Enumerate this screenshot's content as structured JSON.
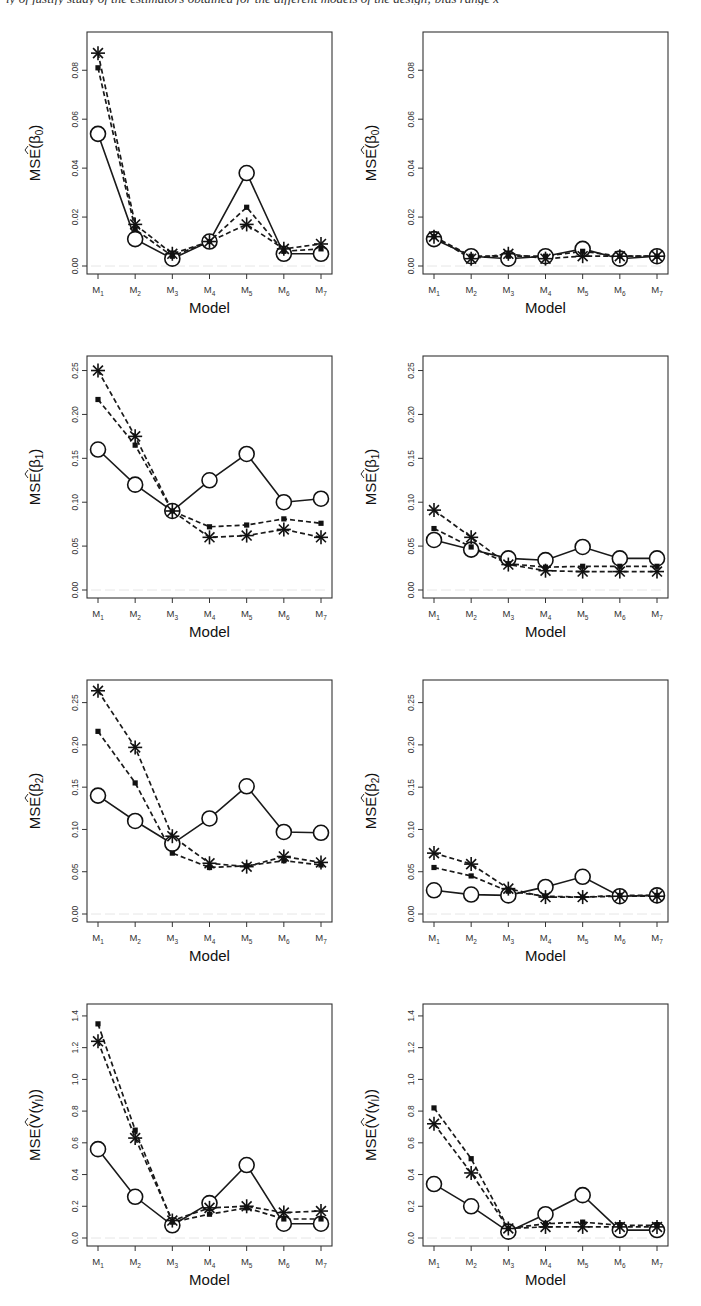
{
  "figure": {
    "caption_fragment": "ly of justify study of the estimators obtained for the different models of the design; bias range x",
    "layout": {
      "rows": 4,
      "cols": 2
    }
  },
  "legend_symbols": {
    "series_a": {
      "name": "circle-solid",
      "marker": "open-circle",
      "line": "solid"
    },
    "series_b": {
      "name": "square-dashed",
      "marker": "filled-square",
      "line": "dashed"
    },
    "series_c": {
      "name": "asterisk-dashed",
      "marker": "asterisk",
      "line": "dashed"
    }
  },
  "chart_data": [
    {
      "id": "beta0-left",
      "type": "line",
      "title": "",
      "xlabel": "Model",
      "ylabel": "MSE(β̂0)",
      "ylabel_parts": {
        "prefix": "MSE(",
        "symbol": "β",
        "sub": "0",
        "suffix": ")",
        "hat": true
      },
      "categories": [
        "M1",
        "M2",
        "M3",
        "M4",
        "M5",
        "M6",
        "M7"
      ],
      "ylim": [
        0,
        0.094
      ],
      "yticks": [
        0.0,
        0.02,
        0.04,
        0.06,
        0.08
      ],
      "ytick_labels": [
        "0.00",
        "0.02",
        "0.04",
        "0.06",
        "0.08"
      ],
      "grid": false,
      "series": [
        {
          "name": "circle-solid",
          "values": [
            0.054,
            0.011,
            0.003,
            0.01,
            0.038,
            0.005,
            0.005
          ]
        },
        {
          "name": "square-dashed",
          "values": [
            0.081,
            0.015,
            0.004,
            0.01,
            0.024,
            0.006,
            0.007
          ]
        },
        {
          "name": "asterisk-dashed",
          "values": [
            0.087,
            0.017,
            0.005,
            0.01,
            0.017,
            0.007,
            0.009
          ]
        }
      ]
    },
    {
      "id": "beta0-right",
      "type": "line",
      "title": "",
      "xlabel": "Model",
      "ylabel": "MSE(β̂0)",
      "ylabel_parts": {
        "prefix": "MSE(",
        "symbol": "β",
        "sub": "0",
        "suffix": ")",
        "hat": true
      },
      "categories": [
        "M1",
        "M2",
        "M3",
        "M4",
        "M5",
        "M6",
        "M7"
      ],
      "ylim": [
        0,
        0.094
      ],
      "yticks": [
        0.0,
        0.02,
        0.04,
        0.06,
        0.08
      ],
      "ytick_labels": [
        "0.00",
        "0.02",
        "0.04",
        "0.06",
        "0.08"
      ],
      "grid": false,
      "series": [
        {
          "name": "circle-solid",
          "values": [
            0.011,
            0.004,
            0.003,
            0.004,
            0.007,
            0.003,
            0.004
          ]
        },
        {
          "name": "square-dashed",
          "values": [
            0.012,
            0.004,
            0.004,
            0.004,
            0.006,
            0.004,
            0.004
          ]
        },
        {
          "name": "asterisk-dashed",
          "values": [
            0.012,
            0.003,
            0.005,
            0.003,
            0.004,
            0.004,
            0.004
          ]
        }
      ]
    },
    {
      "id": "beta1-left",
      "type": "line",
      "title": "",
      "xlabel": "Model",
      "ylabel": "MSE(β̂1)",
      "ylabel_parts": {
        "prefix": "MSE(",
        "symbol": "β",
        "sub": "1",
        "suffix": ")",
        "hat": true
      },
      "categories": [
        "M1",
        "M2",
        "M3",
        "M4",
        "M5",
        "M6",
        "M7"
      ],
      "ylim": [
        0,
        0.262
      ],
      "yticks": [
        0.0,
        0.05,
        0.1,
        0.15,
        0.2,
        0.25
      ],
      "ytick_labels": [
        "0.00",
        "0.05",
        "0.10",
        "0.15",
        "0.20",
        "0.25"
      ],
      "grid": false,
      "series": [
        {
          "name": "circle-solid",
          "values": [
            0.16,
            0.12,
            0.09,
            0.125,
            0.155,
            0.1,
            0.104
          ]
        },
        {
          "name": "square-dashed",
          "values": [
            0.217,
            0.165,
            0.09,
            0.072,
            0.074,
            0.081,
            0.076
          ]
        },
        {
          "name": "asterisk-dashed",
          "values": [
            0.25,
            0.175,
            0.09,
            0.06,
            0.062,
            0.069,
            0.06
          ]
        }
      ]
    },
    {
      "id": "beta1-right",
      "type": "line",
      "title": "",
      "xlabel": "Model",
      "ylabel": "MSE(β̂1)",
      "ylabel_parts": {
        "prefix": "MSE(",
        "symbol": "β",
        "sub": "1",
        "suffix": ")",
        "hat": true
      },
      "categories": [
        "M1",
        "M2",
        "M3",
        "M4",
        "M5",
        "M6",
        "M7"
      ],
      "ylim": [
        0,
        0.262
      ],
      "yticks": [
        0.0,
        0.05,
        0.1,
        0.15,
        0.2,
        0.25
      ],
      "ytick_labels": [
        "0.00",
        "0.05",
        "0.10",
        "0.15",
        "0.20",
        "0.25"
      ],
      "grid": false,
      "series": [
        {
          "name": "circle-solid",
          "values": [
            0.057,
            0.046,
            0.036,
            0.034,
            0.049,
            0.036,
            0.036
          ]
        },
        {
          "name": "square-dashed",
          "values": [
            0.07,
            0.049,
            0.03,
            0.026,
            0.027,
            0.027,
            0.027
          ]
        },
        {
          "name": "asterisk-dashed",
          "values": [
            0.091,
            0.06,
            0.029,
            0.022,
            0.021,
            0.021,
            0.021
          ]
        }
      ]
    },
    {
      "id": "beta2-left",
      "type": "line",
      "title": "",
      "xlabel": "Model",
      "ylabel": "MSE(β̂2)",
      "ylabel_parts": {
        "prefix": "MSE(",
        "symbol": "β",
        "sub": "2",
        "suffix": ")",
        "hat": true
      },
      "categories": [
        "M1",
        "M2",
        "M3",
        "M4",
        "M5",
        "M6",
        "M7"
      ],
      "ylim": [
        0,
        0.272
      ],
      "yticks": [
        0.0,
        0.05,
        0.1,
        0.15,
        0.2,
        0.25
      ],
      "ytick_labels": [
        "0.00",
        "0.05",
        "0.10",
        "0.15",
        "0.20",
        "0.25"
      ],
      "grid": false,
      "series": [
        {
          "name": "circle-solid",
          "values": [
            0.14,
            0.11,
            0.083,
            0.113,
            0.151,
            0.097,
            0.096
          ]
        },
        {
          "name": "square-dashed",
          "values": [
            0.216,
            0.155,
            0.072,
            0.055,
            0.057,
            0.063,
            0.058
          ]
        },
        {
          "name": "asterisk-dashed",
          "values": [
            0.264,
            0.197,
            0.092,
            0.06,
            0.056,
            0.068,
            0.061
          ]
        }
      ]
    },
    {
      "id": "beta2-right",
      "type": "line",
      "title": "",
      "xlabel": "Model",
      "ylabel": "MSE(β̂2)",
      "ylabel_parts": {
        "prefix": "MSE(",
        "symbol": "β",
        "sub": "2",
        "suffix": ")",
        "hat": true
      },
      "categories": [
        "M1",
        "M2",
        "M3",
        "M4",
        "M5",
        "M6",
        "M7"
      ],
      "ylim": [
        0,
        0.272
      ],
      "yticks": [
        0.0,
        0.05,
        0.1,
        0.15,
        0.2,
        0.25
      ],
      "ytick_labels": [
        "0.00",
        "0.05",
        "0.10",
        "0.15",
        "0.20",
        "0.25"
      ],
      "grid": false,
      "series": [
        {
          "name": "circle-solid",
          "values": [
            0.028,
            0.023,
            0.022,
            0.032,
            0.044,
            0.021,
            0.022
          ]
        },
        {
          "name": "square-dashed",
          "values": [
            0.055,
            0.045,
            0.027,
            0.021,
            0.02,
            0.022,
            0.022
          ]
        },
        {
          "name": "asterisk-dashed",
          "values": [
            0.072,
            0.059,
            0.03,
            0.02,
            0.02,
            0.021,
            0.021
          ]
        }
      ]
    },
    {
      "id": "vgamma-left",
      "type": "line",
      "title": "",
      "xlabel": "Model",
      "ylabel": "MSE(V̂(γl))",
      "ylabel_parts": {
        "prefix": "MSE(",
        "symbol": "V(γ",
        "sub": "l",
        "suffix": "))",
        "hat": true
      },
      "categories": [
        "M1",
        "M2",
        "M3",
        "M4",
        "M5",
        "M6",
        "M7"
      ],
      "ylim": [
        0,
        1.45
      ],
      "yticks": [
        0.0,
        0.2,
        0.4,
        0.6,
        0.8,
        1.0,
        1.2,
        1.4
      ],
      "ytick_labels": [
        "0.0",
        "0.2",
        "0.4",
        "0.6",
        "0.8",
        "1.0",
        "1.2",
        "1.4"
      ],
      "grid": false,
      "series": [
        {
          "name": "circle-solid",
          "values": [
            0.56,
            0.26,
            0.08,
            0.22,
            0.46,
            0.09,
            0.09
          ]
        },
        {
          "name": "square-dashed",
          "values": [
            1.35,
            0.68,
            0.1,
            0.15,
            0.19,
            0.12,
            0.12
          ]
        },
        {
          "name": "asterisk-dashed",
          "values": [
            1.24,
            0.63,
            0.11,
            0.19,
            0.2,
            0.16,
            0.17
          ]
        }
      ]
    },
    {
      "id": "vgamma-right",
      "type": "line",
      "title": "",
      "xlabel": "Model",
      "ylabel": "MSE(V̂(γl))",
      "ylabel_parts": {
        "prefix": "MSE(",
        "symbol": "V(γ",
        "sub": "l",
        "suffix": "))",
        "hat": true
      },
      "categories": [
        "M1",
        "M2",
        "M3",
        "M4",
        "M5",
        "M6",
        "M7"
      ],
      "ylim": [
        0,
        1.45
      ],
      "yticks": [
        0.0,
        0.2,
        0.4,
        0.6,
        0.8,
        1.0,
        1.2,
        1.4
      ],
      "ytick_labels": [
        "0.0",
        "0.2",
        "0.4",
        "0.6",
        "0.8",
        "1.0",
        "1.2",
        "1.4"
      ],
      "grid": false,
      "series": [
        {
          "name": "circle-solid",
          "values": [
            0.34,
            0.2,
            0.04,
            0.15,
            0.27,
            0.05,
            0.05
          ]
        },
        {
          "name": "square-dashed",
          "values": [
            0.82,
            0.5,
            0.06,
            0.09,
            0.1,
            0.08,
            0.08
          ]
        },
        {
          "name": "asterisk-dashed",
          "values": [
            0.72,
            0.41,
            0.06,
            0.07,
            0.07,
            0.07,
            0.07
          ]
        }
      ]
    }
  ]
}
